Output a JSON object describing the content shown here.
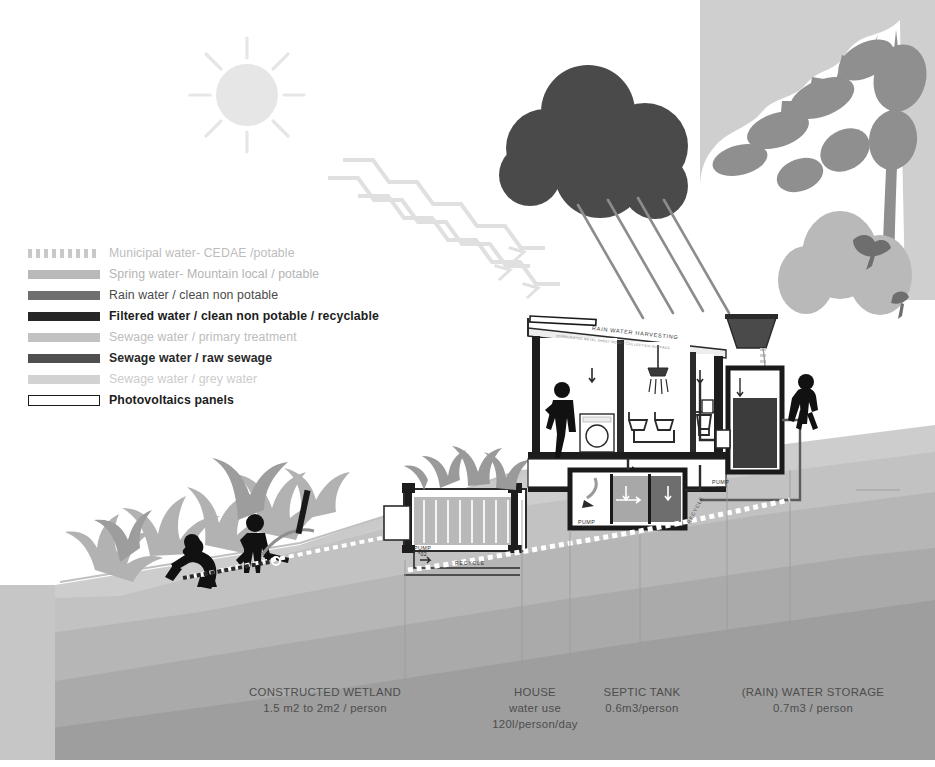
{
  "legend": {
    "items": [
      {
        "label": "Municipal water- CEDAE /potable",
        "style": "dotted",
        "color": "#c9c9c9",
        "text_color": "#bdbdbd",
        "weight": "400"
      },
      {
        "label": "Spring water- Mountain local / potable",
        "style": "solid",
        "color": "#b9b9b9",
        "text_color": "#b4b4b4",
        "weight": "400"
      },
      {
        "label": "Rain water / clean non potable",
        "style": "solid",
        "color": "#6f6f6f",
        "text_color": "#4a4a4a",
        "weight": "400"
      },
      {
        "label": "Filtered water / clean non potable / recyclable",
        "style": "solid",
        "color": "#262626",
        "text_color": "#1c1c1c",
        "weight": "700"
      },
      {
        "label": "Sewage water / primary treatment",
        "style": "solid",
        "color": "#c2c2c2",
        "text_color": "#bcbcbc",
        "weight": "400"
      },
      {
        "label": "Sewage water / raw sewage",
        "style": "solid",
        "color": "#4f4f4f",
        "text_color": "#2a2a2a",
        "weight": "700"
      },
      {
        "label": "Sewage water / grey water",
        "style": "solid",
        "color": "#d2d2d2",
        "text_color": "#cbcbcb",
        "weight": "400"
      },
      {
        "label": "Photovoltaics panels",
        "style": "outline",
        "color": "#ffffff",
        "text_color": "#1c1c1c",
        "weight": "700"
      }
    ]
  },
  "bottom_labels": [
    {
      "title": "CONSTRUCTED WETLAND",
      "value": "1.5 m2 to 2m2 / person",
      "extra": "",
      "left": 215,
      "width": 220
    },
    {
      "title": "HOUSE",
      "value": "water use",
      "extra": "120l/person/day",
      "left": 470,
      "width": 130
    },
    {
      "title": "SEPTIC TANK",
      "value": "0.6m3/person",
      "extra": "",
      "left": 577,
      "width": 130
    },
    {
      "title": "(RAIN) WATER STORAGE",
      "value": "0.7m3 / person",
      "extra": "",
      "left": 718,
      "width": 180
    }
  ],
  "annotations": {
    "roof_primary": "RAIN WATER HARVESTING",
    "roof_secondary": "CORRUGATED METAL SHEET ROOF / COLLECTION SURFACE",
    "pumps": [
      {
        "name": "PUMP",
        "id": "*01",
        "left": 578,
        "top": 519
      },
      {
        "name": "PUMP",
        "id": "*02",
        "left": 414,
        "top": 545
      },
      {
        "name": "PUMP",
        "id": "*03",
        "left": 712,
        "top": 479
      }
    ],
    "recycle_labels": [
      {
        "text": "RECYCLE",
        "left": 455,
        "top": 562,
        "rot": "r1"
      },
      {
        "text": "RECYCLE",
        "left": 686,
        "top": 520,
        "rot": "r2"
      }
    ]
  },
  "colors": {
    "cloud": "#4a4a4a",
    "sun": "#e8e8e8",
    "tree": "#9b9b9b",
    "ground_light": "#cfcfcf",
    "ground_mid": "#b5b5b5",
    "ground_dark": "#9a9a9a",
    "figure": "#111111",
    "tank_dark": "#3c3c3c"
  }
}
